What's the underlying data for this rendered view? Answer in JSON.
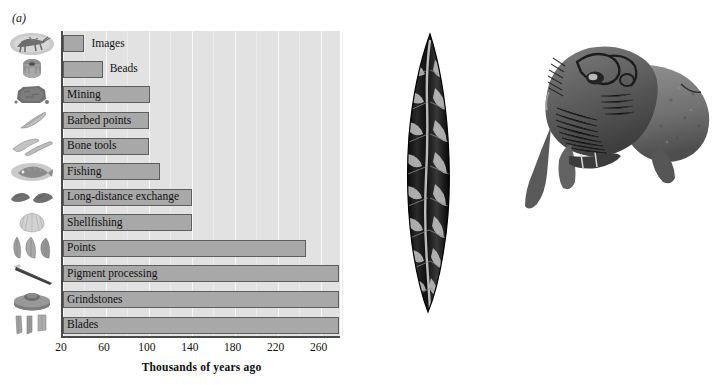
{
  "figure": {
    "panel_a_label": "(a)",
    "panel_b_label": "(b)"
  },
  "chart_data": {
    "type": "bar",
    "orientation": "horizontal",
    "title": "",
    "xlabel": "Thousands of years ago",
    "ylabel": "",
    "xlim": [
      20,
      280
    ],
    "xticks": [
      20,
      60,
      100,
      140,
      180,
      220,
      260
    ],
    "xticklabels": [
      "20",
      "60",
      "100",
      "140",
      "180",
      "220",
      "260"
    ],
    "grid": true,
    "grid_axis": "x",
    "legend": "none",
    "bar_color": "#a8a8a8",
    "bar_edge_color": "#5d5d5d",
    "plot_background": "#e2e2e2",
    "categories": [
      "Images",
      "Beads",
      "Mining",
      "Barbed points",
      "Bone tools",
      "Fishing",
      "Long-distance exchange",
      "Shellfishing",
      "Points",
      "Pigment processing",
      "Grindstones",
      "Blades"
    ],
    "values": [
      40,
      57,
      101,
      100,
      100,
      110,
      140,
      140,
      246,
      277,
      277,
      277
    ],
    "note": "Bars start at 20 ka (left axis) and extend to the age of earliest evidence.",
    "icons": [
      "rock-art-animal-icon",
      "bead-icon",
      "ochre-mining-icon",
      "barbed-point-icon",
      "bone-tool-icon",
      "fish-icon",
      "obsidian-flake-icon",
      "seashell-icon",
      "stone-points-icon",
      "pigment-crayon-icon",
      "grindstone-icon",
      "stone-blades-icon"
    ]
  },
  "panel_b": {
    "artifacts": [
      {
        "name": "stone-blade-point-artifact",
        "caption": ""
      },
      {
        "name": "carved-bison-sculpture-artifact",
        "caption": ""
      }
    ]
  }
}
